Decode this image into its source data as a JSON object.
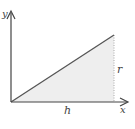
{
  "diagram": {
    "type": "right-triangle-cone-generator",
    "axes": {
      "x_label": "x",
      "y_label": "y"
    },
    "labels": {
      "base": "h",
      "height": "r"
    },
    "colors": {
      "fill": "#eeeeee",
      "line": "#555555",
      "axis": "#444444",
      "dotted": "#aaaaaa"
    },
    "geometry": {
      "origin": [
        11,
        102
      ],
      "apex": [
        114,
        35
      ],
      "base_end": [
        114,
        102
      ]
    }
  }
}
